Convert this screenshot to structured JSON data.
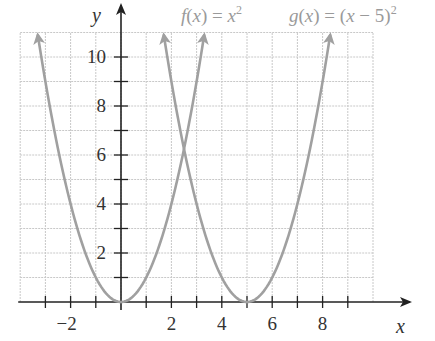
{
  "chart_data": {
    "type": "line",
    "title": "",
    "xlabel": "x",
    "ylabel": "y",
    "xlim": [
      -4,
      10
    ],
    "ylim": [
      0,
      11
    ],
    "grid": true,
    "x_ticks": [
      -3,
      -2,
      -1,
      1,
      2,
      3,
      4,
      5,
      6,
      7,
      8,
      9
    ],
    "x_tick_labels": [
      "-2",
      "2",
      "4",
      "6",
      "8"
    ],
    "x_tick_label_values": [
      -2,
      2,
      4,
      6,
      8
    ],
    "y_ticks": [
      1,
      2,
      3,
      4,
      5,
      6,
      7,
      8,
      9,
      10
    ],
    "y_tick_labels": [
      "2",
      "4",
      "6",
      "8",
      "10"
    ],
    "y_tick_label_values": [
      2,
      4,
      6,
      8,
      10
    ],
    "series": [
      {
        "name": "f(x) = x^2",
        "label_html": "f(x) = x²",
        "expression": "x^2",
        "x_range": [
          -3.3,
          3.3
        ],
        "color": "#a0a0a0",
        "x": [
          -3,
          -2,
          -1,
          0,
          1,
          2,
          3
        ],
        "values": [
          9,
          4,
          1,
          0,
          1,
          4,
          9
        ]
      },
      {
        "name": "g(x) = (x - 5)^2",
        "label_html": "g(x) = (x − 5)²",
        "expression": "(x-5)^2",
        "x_range": [
          1.7,
          8.3
        ],
        "color": "#a0a0a0",
        "x": [
          2,
          3,
          4,
          5,
          6,
          7,
          8
        ],
        "values": [
          9,
          4,
          1,
          0,
          1,
          4,
          9
        ]
      }
    ],
    "annotations": [
      {
        "text": "f(x) = x²",
        "position": "top, above x≈2.5"
      },
      {
        "text": "g(x) = (x − 5)²",
        "position": "top right"
      }
    ],
    "legend_position": "top, inline labels"
  },
  "labels": {
    "x_axis": "x",
    "y_axis": "y",
    "f_name": "f",
    "f_open": "(",
    "f_var": "x",
    "f_close": ") = ",
    "f_expr_var": "x",
    "f_exp": "2",
    "g_name": "g",
    "g_open": "(",
    "g_var": "x",
    "g_close": ") = (",
    "g_expr_var": "x",
    "g_minus": " − 5)",
    "g_exp": "2"
  },
  "colors": {
    "curve": "#a0a0a0",
    "axis": "#222222",
    "grid": "#c8c8c8",
    "text": "#333333",
    "legend_text": "#9a9a9a"
  }
}
